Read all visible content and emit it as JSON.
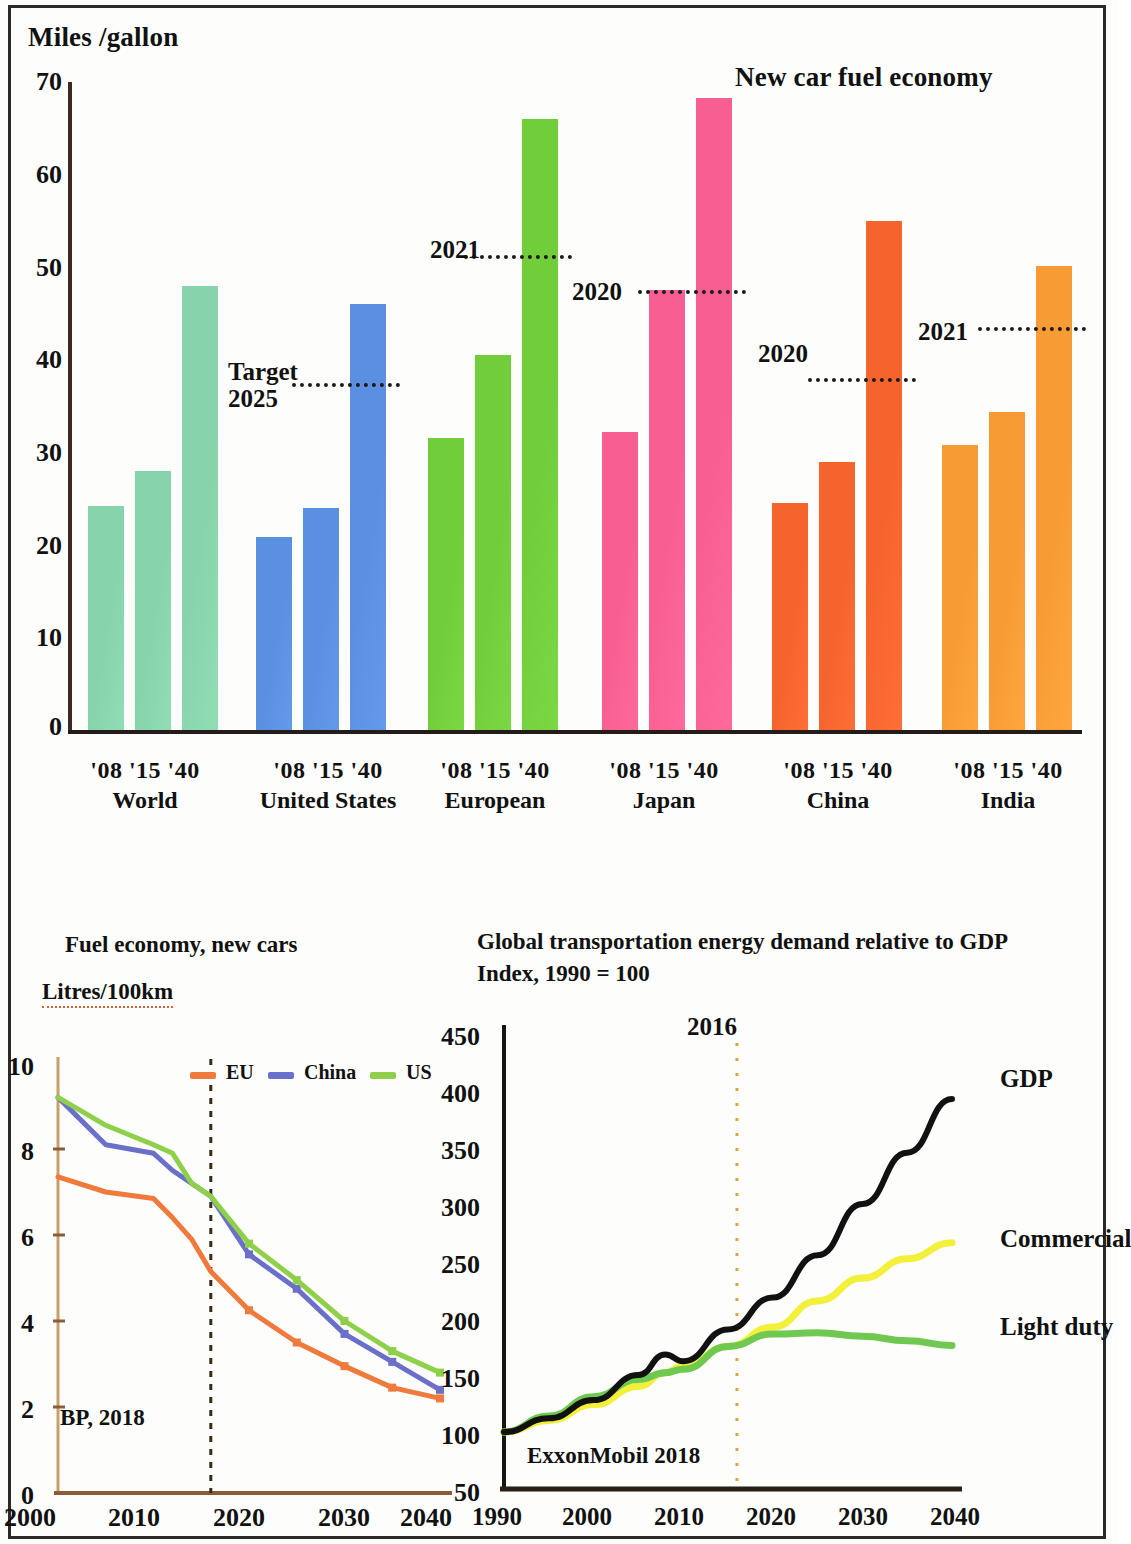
{
  "bar_panel": {
    "axis_unit": "Miles /gallon",
    "title": "New car fuel economy",
    "y_ticks": [
      "70",
      "60",
      "50",
      "40",
      "30",
      "20",
      "10",
      "0"
    ],
    "groups": [
      {
        "name": "World",
        "years": "'08 '15 '40"
      },
      {
        "name": "United States",
        "years": "'08 '15 '40"
      },
      {
        "name": "European",
        "years": "'08 '15 '40"
      },
      {
        "name": "Japan",
        "years": "'08 '15 '40"
      },
      {
        "name": "China",
        "years": "'08 '15 '40"
      },
      {
        "name": "India",
        "years": "'08 '15 '40"
      }
    ],
    "target_labels": [
      {
        "text": "Target\n2025"
      },
      {
        "text": "2021"
      },
      {
        "text": "2020"
      },
      {
        "text": "2020"
      },
      {
        "text": "2021"
      }
    ]
  },
  "left_line_panel": {
    "title": "Fuel economy, new cars",
    "unit": "Litres/100km",
    "source": "BP, 2018",
    "y_ticks": [
      "10",
      "8",
      "6",
      "4",
      "2",
      "0"
    ],
    "x_ticks": [
      "2000",
      "2010",
      "2020",
      "2030",
      "2040"
    ],
    "legend": [
      {
        "label": "EU",
        "color": "#f0793c"
      },
      {
        "label": "China",
        "color": "#6a6fc9"
      },
      {
        "label": "US",
        "color": "#8ed04a"
      }
    ]
  },
  "right_line_panel": {
    "title_line1": "Global transportation energy demand relative to GDP",
    "title_line2": "Index, 1990 = 100",
    "source": "ExxonMobil 2018",
    "annotation": "2016",
    "y_ticks": [
      "450",
      "400",
      "350",
      "300",
      "250",
      "200",
      "150",
      "100",
      "50"
    ],
    "x_ticks": [
      "1990",
      "2000",
      "2010",
      "2020",
      "2030",
      "2040"
    ],
    "series_labels": [
      "GDP",
      "Commercial",
      "Light duty"
    ]
  },
  "chart_data": [
    {
      "type": "bar",
      "title": "New car fuel economy",
      "ylabel": "Miles /gallon",
      "xlabel": "",
      "ylim": [
        0,
        70
      ],
      "grid": false,
      "legend_position": "none",
      "categories": [
        "'08",
        "'15",
        "'40"
      ],
      "groups": [
        {
          "name": "World",
          "color": "#87d3ab",
          "values": [
            24.2,
            28.0,
            48.0
          ],
          "target": null
        },
        {
          "name": "United States",
          "color": "#5b8fe0",
          "values": [
            20.9,
            24.0,
            46.0
          ],
          "target": {
            "label": "Target 2025",
            "value": 37.5
          }
        },
        {
          "name": "European",
          "color": "#72cd3a",
          "values": [
            31.5,
            40.5,
            66.0
          ],
          "target": {
            "label": "2021",
            "value": 51.3
          }
        },
        {
          "name": "Japan",
          "color": "#f75f92",
          "values": [
            32.2,
            47.5,
            68.3
          ],
          "target": {
            "label": "2020",
            "value": 47.5
          }
        },
        {
          "name": "China",
          "color": "#f4652e",
          "values": [
            24.5,
            29.0,
            55.0
          ],
          "target": {
            "label": "2020",
            "value": 38.0
          }
        },
        {
          "name": "India",
          "color": "#f79c34",
          "values": [
            30.8,
            34.3,
            50.1
          ],
          "target": {
            "label": "2021",
            "value": 43.5
          }
        }
      ]
    },
    {
      "type": "line",
      "title": "Fuel economy, new cars",
      "ylabel": "Litres/100km",
      "xlabel": "",
      "ylim": [
        0,
        10
      ],
      "xlim": [
        2000,
        2040
      ],
      "grid": false,
      "legend_position": "top",
      "source": "BP, 2018",
      "annotations": [
        {
          "type": "vline",
          "x": 2016,
          "style": "dotted"
        }
      ],
      "x": [
        2000,
        2005,
        2010,
        2012,
        2014,
        2016,
        2020,
        2025,
        2030,
        2035,
        2040
      ],
      "series": [
        {
          "name": "EU",
          "color": "#f0793c",
          "values": [
            7.35,
            7.0,
            6.85,
            6.4,
            5.9,
            5.15,
            4.25,
            3.5,
            2.95,
            2.45,
            2.2
          ]
        },
        {
          "name": "China",
          "color": "#6a6fc9",
          "values": [
            9.2,
            8.1,
            7.9,
            7.5,
            7.2,
            6.9,
            5.55,
            4.75,
            3.7,
            3.05,
            2.4
          ]
        },
        {
          "name": "US",
          "color": "#8ed04a",
          "values": [
            9.2,
            8.55,
            8.1,
            7.9,
            7.2,
            6.9,
            5.8,
            4.95,
            4.0,
            3.3,
            2.8
          ]
        }
      ]
    },
    {
      "type": "line",
      "title": "Global transportation energy demand relative to GDP",
      "subtitle": "Index, 1990 = 100",
      "ylabel": "",
      "xlabel": "",
      "ylim": [
        50,
        450
      ],
      "xlim": [
        1990,
        2040
      ],
      "grid": false,
      "legend_position": "right-inline",
      "source": "ExxonMobil 2018",
      "annotations": [
        {
          "type": "vline",
          "x": 2016,
          "style": "dotted",
          "label": "2016"
        }
      ],
      "x": [
        1990,
        1995,
        2000,
        2005,
        2008,
        2010,
        2015,
        2020,
        2025,
        2030,
        2035,
        2040
      ],
      "series": [
        {
          "name": "GDP",
          "color": "#111111",
          "values": [
            100,
            112,
            128,
            150,
            168,
            162,
            190,
            218,
            255,
            300,
            345,
            392
          ]
        },
        {
          "name": "Commercial",
          "color": "#f2f03a",
          "values": [
            100,
            110,
            124,
            140,
            152,
            158,
            175,
            192,
            215,
            235,
            252,
            266
          ]
        },
        {
          "name": "Light duty",
          "color": "#6fc850",
          "values": [
            100,
            114,
            131,
            146,
            152,
            155,
            175,
            186,
            187,
            184,
            180,
            176
          ]
        }
      ]
    }
  ]
}
